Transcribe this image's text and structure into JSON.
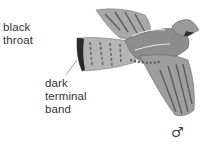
{
  "illustration": {
    "subject": "grouse in flight",
    "palette": {
      "ink": "#333333",
      "mid": "#8a8a8a",
      "light": "#c8c8c8",
      "band": "#2a2a2a"
    }
  },
  "labels": {
    "throat": [
      "black",
      "throat"
    ],
    "band": [
      "dark",
      "terminal",
      "band"
    ]
  },
  "sex_symbol": "♂"
}
